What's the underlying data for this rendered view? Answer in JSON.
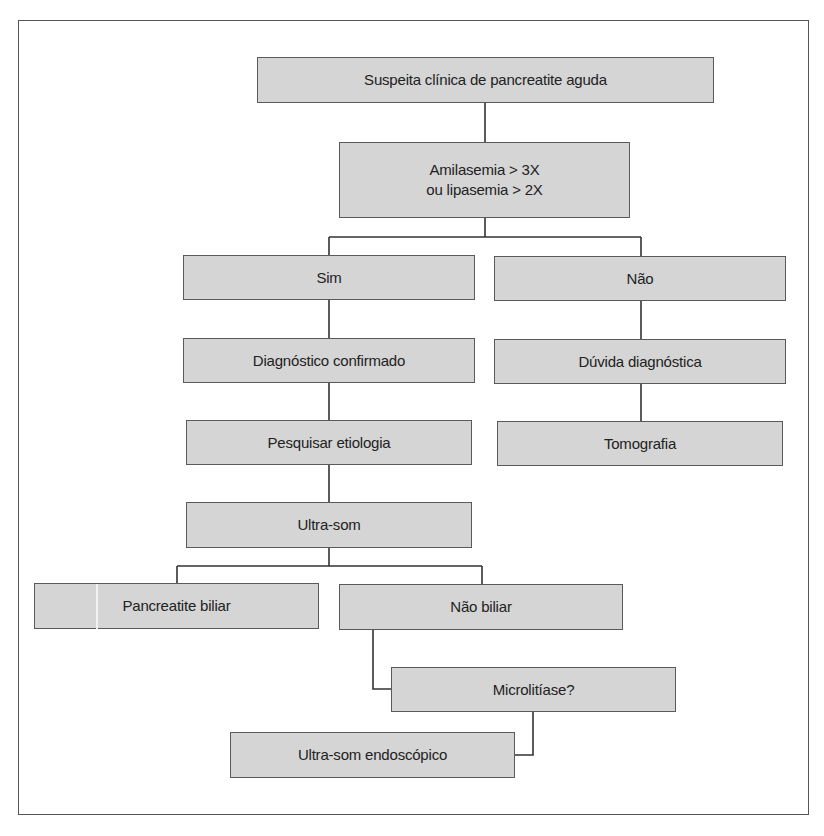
{
  "flowchart": {
    "nodes": {
      "suspeita": "Suspeita clínica de pancreatite aguda",
      "enzimas_line1": "Amilasemia > 3X",
      "enzimas_line2": "ou lipasemia > 2X",
      "sim": "Sim",
      "nao": "Não",
      "diag_confirmado": "Diagnóstico confirmado",
      "duvida": "Dúvida diagnóstica",
      "pesquisar": "Pesquisar etiologia",
      "tomografia": "Tomografia",
      "ultrasom": "Ultra-som",
      "pancreatite_biliar": "Pancreatite biliar",
      "nao_biliar": "Não biliar",
      "microlitiase": "Microlitíase?",
      "ultrasom_endo": "Ultra-som endoscópico"
    },
    "colors": {
      "box_fill": "#d5d5d5",
      "box_border": "#5a5a5a",
      "line": "#333333",
      "text": "#222222"
    }
  }
}
